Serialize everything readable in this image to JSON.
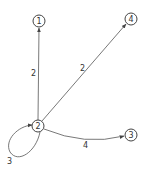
{
  "graph": {
    "nodes": [
      {
        "id": "1",
        "label": "1",
        "x": 39,
        "y": 21
      },
      {
        "id": "4",
        "label": "4",
        "x": 131,
        "y": 19
      },
      {
        "id": "2",
        "label": "2",
        "x": 38,
        "y": 126
      },
      {
        "id": "3",
        "label": "3",
        "x": 131,
        "y": 135
      }
    ],
    "edges": [
      {
        "from": "2",
        "to": "1",
        "weight": "2"
      },
      {
        "from": "2",
        "to": "4",
        "weight": "2"
      },
      {
        "from": "2",
        "to": "3",
        "weight": "4"
      },
      {
        "from": "2",
        "to": "2",
        "weight": "3"
      }
    ]
  }
}
